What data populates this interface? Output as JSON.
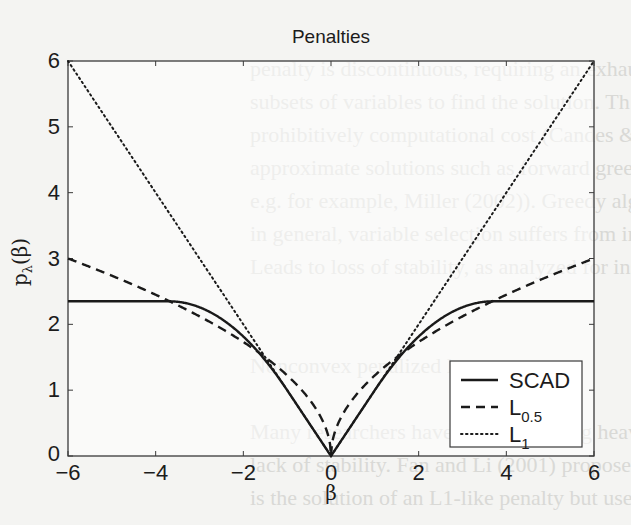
{
  "chart_data": {
    "type": "line",
    "title": "Penalties",
    "xlabel": "β",
    "ylabel": "p_λ(β)",
    "xlim": [
      -6,
      6
    ],
    "ylim": [
      0,
      6
    ],
    "xticks": [
      -6,
      -4,
      -2,
      0,
      2,
      4,
      6
    ],
    "yticks": [
      0,
      1,
      2,
      3,
      4,
      5,
      6
    ],
    "xtick_labels": [
      "−6",
      "−4",
      "−2",
      "0",
      "2",
      "4",
      "6"
    ],
    "ytick_labels": [
      "0",
      "1",
      "2",
      "3",
      "4",
      "5",
      "6"
    ],
    "grid": false,
    "legend_position": "lower right",
    "x": [
      -6,
      -5,
      -4,
      -3.7,
      -3,
      -2,
      -1.5,
      -1,
      -0.5,
      0,
      0.5,
      1,
      1.5,
      2,
      3,
      3.7,
      4,
      5,
      6
    ],
    "series": [
      {
        "name": "SCAD",
        "legend_main": "SCAD",
        "legend_sub": "",
        "style": "solid",
        "values": [
          2.35,
          2.35,
          2.35,
          2.35,
          2.23,
          1.83,
          1.46,
          1.0,
          0.5,
          0,
          0.5,
          1.0,
          1.46,
          1.83,
          2.23,
          2.35,
          2.35,
          2.35,
          2.35
        ]
      },
      {
        "name": "L0.5",
        "legend_main": "L",
        "legend_sub": "0.5",
        "style": "dashed",
        "values": [
          3.0,
          2.74,
          2.45,
          2.36,
          2.12,
          1.73,
          1.5,
          1.22,
          0.87,
          0,
          0.87,
          1.22,
          1.5,
          1.73,
          2.12,
          2.36,
          2.45,
          2.74,
          3.0
        ]
      },
      {
        "name": "L1",
        "legend_main": "L",
        "legend_sub": "1",
        "style": "dotted",
        "values": [
          6,
          5,
          4,
          3.7,
          3,
          2,
          1.5,
          1,
          0.5,
          0,
          0.5,
          1,
          1.5,
          2,
          3,
          3.7,
          4,
          5,
          6
        ]
      }
    ]
  },
  "background_bleed_text": [
    "penalty is discontinuous, requiring an exhaustive",
    "subsets of variables to find the solution. Th",
    "prohibitively computational cost (Candes & Plan",
    "approximate solutions such as forward greedy select",
    "e.g. for example, Miller (2002)). Greedy algorithms",
    "in general, variable selection suffers from instability",
    "Leads to loss of stability, as analyzed for instance",
    "",
    "",
    "Nonconvex penalized least-squares",
    "",
    "Many researchers have proposed using heavy nonconve",
    "lack of stability. Fan and Li (2001) proposed the SCA",
    "is the solution of an L1-like penalty but used in"
  ]
}
